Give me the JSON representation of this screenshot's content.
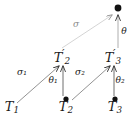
{
  "figure": {
    "kind": "commutative-diagram",
    "width": 136,
    "height": 121,
    "background": "#ffffff",
    "ink_color": "#1a1a1a",
    "faded_color": "#b8b8b8",
    "faded_label_color": "#8c8c8c"
  },
  "nodes": [
    {
      "id": "T1",
      "base": "T",
      "sub": "1",
      "prime": "",
      "label": "T₁",
      "x": 12,
      "y": 108,
      "has_dot": false
    },
    {
      "id": "T2",
      "base": "T",
      "sub": "2",
      "prime": "",
      "label": "T₂",
      "x": 66,
      "y": 108,
      "dot_x": 66,
      "dot_y": 99,
      "has_dot": true
    },
    {
      "id": "T3",
      "base": "T",
      "sub": "3",
      "prime": "",
      "label": "T₃",
      "x": 115,
      "y": 108,
      "dot_x": 115,
      "dot_y": 99,
      "has_dot": true
    },
    {
      "id": "T2p",
      "base": "T",
      "sub": "2",
      "prime": "′",
      "label": "T′₂",
      "x": 62,
      "y": 57,
      "has_dot": false
    },
    {
      "id": "T3p",
      "base": "T",
      "sub": "3",
      "prime": "′",
      "label": "T′₃",
      "x": 113,
      "y": 57,
      "has_dot": false
    },
    {
      "id": "top",
      "base": "",
      "sub": "",
      "prime": "",
      "label": "",
      "x": 118,
      "y": 8,
      "dot_x": 118,
      "dot_y": 8,
      "has_dot": true
    }
  ],
  "arrows": [
    {
      "id": "sigma1",
      "from": "T1",
      "to": "T2p",
      "label": "σ₁",
      "label_x": 22,
      "label_y": 72,
      "faded": false,
      "style": "diagonal"
    },
    {
      "id": "theta1",
      "from": "T2",
      "to": "T2p",
      "label": "θ₁",
      "label_x": 53,
      "label_y": 80,
      "faded": false,
      "style": "vertical"
    },
    {
      "id": "sigma2",
      "from": "T2",
      "to": "T3p",
      "label": "σ₂",
      "label_x": 80,
      "label_y": 72,
      "faded": false,
      "style": "diagonal"
    },
    {
      "id": "theta2",
      "from": "T3",
      "to": "T3p",
      "label": "θ₂",
      "label_x": 120,
      "label_y": 80,
      "faded": false,
      "style": "vertical"
    },
    {
      "id": "sigma",
      "from": "T2p",
      "to": "top",
      "label": "σ",
      "label_x": 76,
      "label_y": 24,
      "faded": true,
      "style": "diagonal"
    },
    {
      "id": "theta",
      "from": "T3p",
      "to": "top",
      "label": "θ",
      "label_x": 124,
      "label_y": 31,
      "faded": false,
      "style": "vertical"
    }
  ]
}
